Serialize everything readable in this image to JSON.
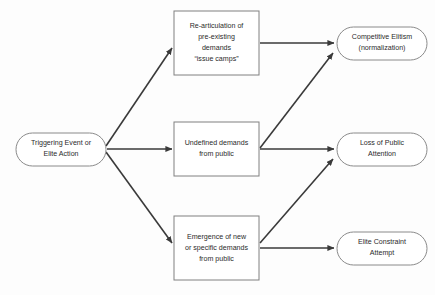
{
  "diagram": {
    "background_color": "#fdfdfd",
    "box_stroke_color": "#808080",
    "arrow_color": "#3a3a3a",
    "text_color": "#2b2b2b",
    "nodes": {
      "trigger": {
        "id": "trigger",
        "shape": "stadium",
        "lines": [
          "Triggering Event or",
          "Elite Action"
        ],
        "line1": "Triggering Event or",
        "line2": "Elite Action"
      },
      "rearticulation": {
        "id": "rearticulation",
        "shape": "rectangle",
        "lines": [
          "Re-articulation of",
          "pre-existing",
          "demands",
          "“issue camps”"
        ],
        "line1": "Re-articulation of",
        "line2": "pre-existing",
        "line3": "demands",
        "line4": "“issue camps”"
      },
      "undefined_demands": {
        "id": "undefined_demands",
        "shape": "rectangle",
        "lines": [
          "Undefined demands",
          "from public"
        ],
        "line1": "Undefined demands",
        "line2": "from public"
      },
      "emergence": {
        "id": "emergence",
        "shape": "rectangle",
        "lines": [
          "Emergence of new",
          "or specific demands",
          "from public"
        ],
        "line1": "Emergence of new",
        "line2": "or specific demands",
        "line3": "from public"
      },
      "competitive_elitism": {
        "id": "competitive_elitism",
        "shape": "stadium",
        "lines": [
          "Competitive Elitism",
          "(normalization)"
        ],
        "line1": "Competitive Elitism",
        "line2": "(normalization)"
      },
      "loss_of_attention": {
        "id": "loss_of_attention",
        "shape": "stadium",
        "lines": [
          "Loss of Public",
          "Attention"
        ],
        "line1": "Loss of Public",
        "line2": "Attention"
      },
      "elite_constraint": {
        "id": "elite_constraint",
        "shape": "stadium",
        "lines": [
          "Elite Constraint",
          "Attempt"
        ],
        "line1": "Elite Constraint",
        "line2": "Attempt"
      }
    },
    "edges": [
      {
        "id": "trigger-to-rearticulation",
        "from": "trigger",
        "to": "rearticulation",
        "style": "diagonal-up"
      },
      {
        "id": "trigger-to-undefined",
        "from": "trigger",
        "to": "undefined_demands",
        "style": "horizontal"
      },
      {
        "id": "trigger-to-emergence",
        "from": "trigger",
        "to": "emergence",
        "style": "diagonal-down"
      },
      {
        "id": "rearticulation-to-competitive-elitism",
        "from": "rearticulation",
        "to": "competitive_elitism",
        "style": "horizontal"
      },
      {
        "id": "undefined-to-competitive-elitism",
        "from": "undefined_demands",
        "to": "competitive_elitism",
        "style": "diagonal-up"
      },
      {
        "id": "undefined-to-loss-of-attention",
        "from": "undefined_demands",
        "to": "loss_of_attention",
        "style": "horizontal"
      },
      {
        "id": "emergence-to-loss-of-attention",
        "from": "emergence",
        "to": "loss_of_attention",
        "style": "diagonal-up"
      },
      {
        "id": "emergence-to-elite-constraint",
        "from": "emergence",
        "to": "elite_constraint",
        "style": "horizontal"
      }
    ]
  }
}
